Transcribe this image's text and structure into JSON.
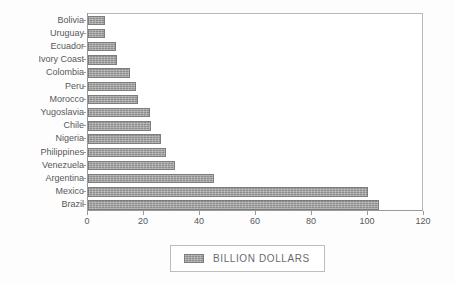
{
  "chart_data": {
    "type": "bar",
    "orientation": "horizontal",
    "title": "",
    "xlabel": "",
    "ylabel": "",
    "xlim": [
      0,
      120
    ],
    "xticks": [
      0,
      20,
      40,
      60,
      80,
      100,
      120
    ],
    "grid": false,
    "legend": {
      "position": "bottom",
      "entries": [
        "BILLION DOLLARS"
      ]
    },
    "series": [
      {
        "name": "BILLION DOLLARS",
        "color": "#8c8c8c",
        "values": [
          6,
          6,
          10,
          10.5,
          15,
          17,
          18,
          22,
          22.5,
          26,
          28,
          31,
          45,
          100,
          104
        ]
      }
    ],
    "categories": [
      "Bolivia",
      "Uruguay",
      "Ecuador",
      "Ivory Coast",
      "Colombia",
      "Peru",
      "Morocco",
      "Yugoslavia",
      "Chile",
      "Nigeria",
      "Philippines",
      "Venezuela",
      "Argentina",
      "Mexico",
      "Brazil"
    ]
  },
  "axis": {
    "x_tick_labels": [
      "0",
      "20",
      "40",
      "60",
      "80",
      "100",
      "120"
    ]
  },
  "legend": {
    "label": "BILLION DOLLARS"
  },
  "colors": {
    "bar_fill": "#8c8c8c",
    "bar_stroke": "#7d7d7d",
    "axis": "#9a9a9a",
    "text": "#58585a",
    "background": "#fdfdfd"
  }
}
